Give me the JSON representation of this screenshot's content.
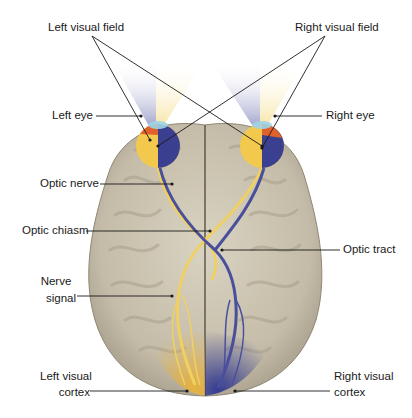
{
  "diagram": {
    "labels": {
      "left_visual_field": "Left visual field",
      "right_visual_field": "Right visual field",
      "left_eye": "Left eye",
      "right_eye": "Right eye",
      "optic_nerve": "Optic nerve",
      "optic_chiasm": "Optic chiasm",
      "optic_tract": "Optic tract",
      "nerve_signal_line1": "Nerve",
      "nerve_signal_line2": "signal",
      "left_visual_cortex_line1": "Left visual",
      "left_visual_cortex_line2": "cortex",
      "right_visual_cortex_line1": "Right visual",
      "right_visual_cortex_line2": "cortex"
    },
    "colors": {
      "left_field": "#f2c94c",
      "right_field": "#3b3f8f",
      "brain": "#c9c2b0",
      "brain_shadow": "#9c9482",
      "eye_orange": "#e0622a",
      "leader_line": "#1a1a1a"
    }
  }
}
